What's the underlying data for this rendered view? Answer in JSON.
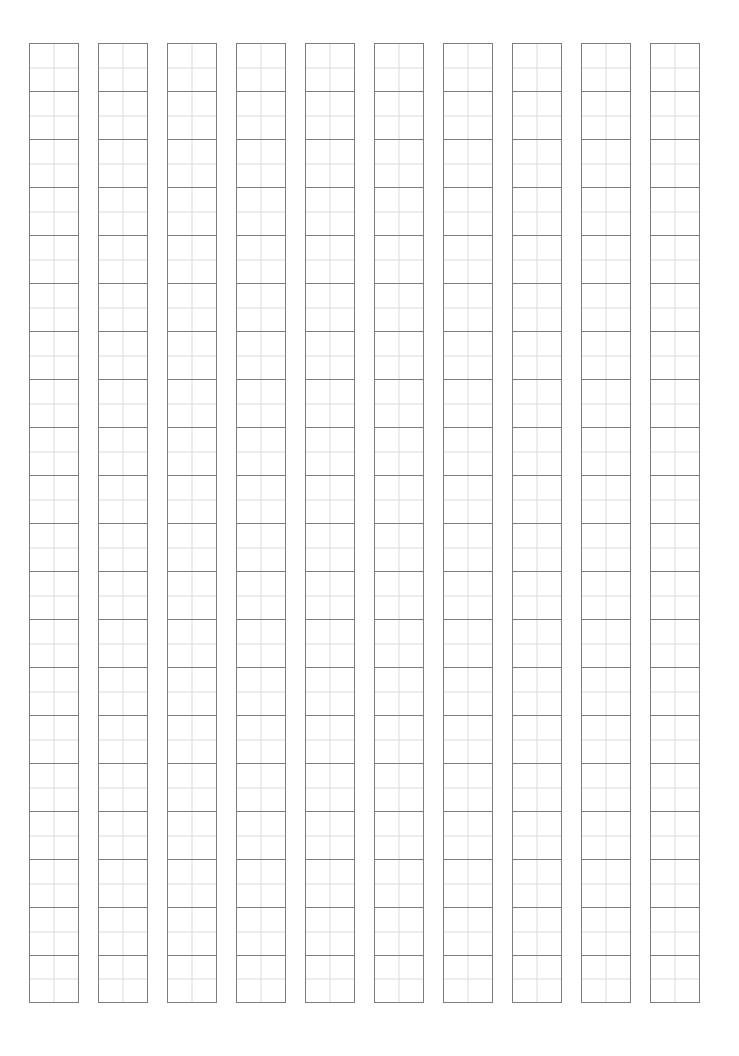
{
  "page": {
    "background_color": "#ffffff",
    "width_px": 739,
    "height_px": 1056
  },
  "grid": {
    "description": "Ruled manuscript writing sheet of vertical columns of square cells, each cell subdivided into quarters by faint center lines",
    "columns": 10,
    "rows_per_column": 20,
    "origin_x_px": 29,
    "origin_y_px": 43,
    "column_width_px": 50,
    "column_pitch_px": 69,
    "column_gap_px": 19,
    "cell_height_px": 48,
    "major_line_color": "#7d7d7d",
    "minor_line_color": "#dcdcdc",
    "major_line_width_px": 1,
    "minor_line_width_px": 1,
    "cell_fill_color": "#ffffff",
    "subdivisions_per_cell": 4
  }
}
